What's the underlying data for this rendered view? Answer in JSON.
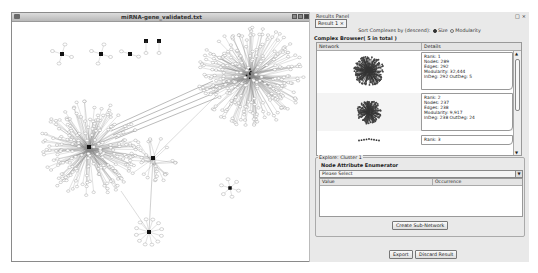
{
  "network_window": {
    "title": "miRNA-gene_validated.txt",
    "controls": [
      "minimize",
      "maximize",
      "close"
    ]
  },
  "results_panel": {
    "title": "Results Panel",
    "controls": [
      "float",
      "close"
    ],
    "result_tab": "Result 1 ×",
    "sort_label": "Sort Complexes by (descend):",
    "sort_options": [
      {
        "label": "Size",
        "selected": true
      },
      {
        "label": "Modularity",
        "selected": false
      }
    ],
    "complex_browser_title": "Complex Browser( 5 in total )",
    "columns": [
      "Network",
      "Details"
    ],
    "complexes": [
      {
        "rank": "Rank: 1",
        "nodes": "Nodes: 289",
        "edges": "Edges: 292",
        "modularity": "Modularity: 32,444",
        "degree": "InDeg: 292 OutDeg: 5"
      },
      {
        "rank": "Rank: 2",
        "nodes": "Nodes: 237",
        "edges": "Edges: 238",
        "modularity": "Modularity: 9,917",
        "degree": "InDeg: 238 OutDeg: 24"
      },
      {
        "rank": "Rank: 3"
      }
    ],
    "explore": {
      "label": "Explore: Cluster 1",
      "title": "Node Attribute Enumerator",
      "select_value": "Please Select",
      "columns": [
        "Value",
        "Occurrence"
      ],
      "create_button": "Create Sub-Network"
    },
    "export_button": "Export",
    "discard_button": "Discard Result"
  }
}
